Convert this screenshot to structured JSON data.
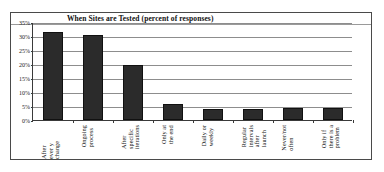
{
  "chart_data": {
    "type": "bar",
    "title": "When Sites are Tested (percent of responses)",
    "xlabel": "",
    "ylabel": "",
    "ylim": [
      0,
      35
    ],
    "ytick_labels": [
      "0%",
      "5%",
      "10%",
      "15%",
      "20%",
      "25%",
      "30%",
      "35%"
    ],
    "ytick_values": [
      0,
      5,
      10,
      15,
      20,
      25,
      30,
      35
    ],
    "grid": true,
    "legend": "none",
    "categories": [
      "After\never y change",
      "Ongoing\nprocess",
      "After\nspecific\niterations",
      "Only at\nthe end",
      "Daily or\nweekly",
      "Regular\nintervals\nafter\nlaunch",
      "Never/not\noften",
      "Only if\nthere is a\nproblem"
    ],
    "categories_plain": [
      "After every change",
      "Ongoing process",
      "After specific iterations",
      "Only at the end",
      "Daily or weekly",
      "Regular intervals after launch",
      "Never/not often",
      "Only if there is a problem"
    ],
    "values": [
      31.5,
      30.5,
      19.8,
      5.8,
      4.0,
      4.0,
      4.2,
      4.3
    ],
    "bar_color": "#2b2b2b",
    "plot_background": "#ffffff",
    "border_color": "#4a4a4a"
  }
}
